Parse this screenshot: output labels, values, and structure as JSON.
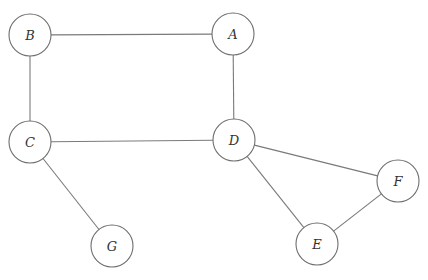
{
  "diagram": {
    "type": "undirected-graph",
    "colors": {
      "edge": "#7a7a7a",
      "node_stroke": "#6e6e6e",
      "node_fill": "#ffffff",
      "label": "#333333",
      "background": "#ffffff"
    },
    "nodes": [
      {
        "id": "A",
        "label": "A",
        "x": 233,
        "y": 34,
        "r": 21
      },
      {
        "id": "B",
        "label": "B",
        "x": 30,
        "y": 35,
        "r": 21
      },
      {
        "id": "C",
        "label": "C",
        "x": 30,
        "y": 142,
        "r": 21
      },
      {
        "id": "D",
        "label": "D",
        "x": 234,
        "y": 140,
        "r": 21
      },
      {
        "id": "E",
        "label": "E",
        "x": 317,
        "y": 244,
        "r": 21
      },
      {
        "id": "F",
        "label": "F",
        "x": 398,
        "y": 181,
        "r": 21
      },
      {
        "id": "G",
        "label": "G",
        "x": 112,
        "y": 246,
        "r": 21
      }
    ],
    "edges": [
      {
        "from": "B",
        "to": "A"
      },
      {
        "from": "B",
        "to": "C"
      },
      {
        "from": "A",
        "to": "D"
      },
      {
        "from": "C",
        "to": "D"
      },
      {
        "from": "C",
        "to": "G"
      },
      {
        "from": "D",
        "to": "F"
      },
      {
        "from": "D",
        "to": "E"
      },
      {
        "from": "E",
        "to": "F"
      }
    ]
  }
}
